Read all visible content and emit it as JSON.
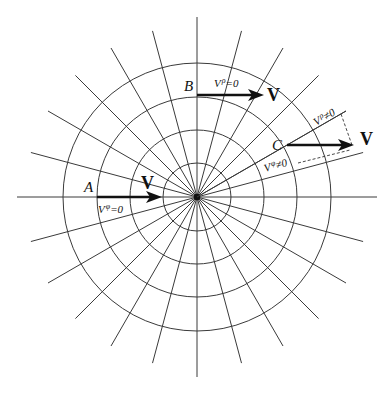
{
  "figure": {
    "type": "polar-coordinate-grid",
    "center": [
      197,
      197
    ],
    "circle_radii": [
      34,
      67,
      100,
      134
    ],
    "ray_step_deg": 15,
    "axis_length": 180,
    "ray_length": 172,
    "line_color": "#3a3a3a",
    "vector_color": "#111111"
  },
  "points": [
    {
      "id": "A",
      "label": "A",
      "vector_label": "V",
      "component_main": "V",
      "component_sup": "φ",
      "component_rest": "=0"
    },
    {
      "id": "B",
      "label": "B",
      "vector_label": "V",
      "component_main": "V",
      "component_sup": "ρ",
      "component_rest": "=0"
    },
    {
      "id": "C",
      "label": "C",
      "vector_label": "V",
      "radial_main": "V",
      "radial_sup": "ρ",
      "radial_rest": "≠0",
      "tangential_main": "V",
      "tangential_sup": "φ",
      "tangential_rest": "≠0"
    }
  ]
}
